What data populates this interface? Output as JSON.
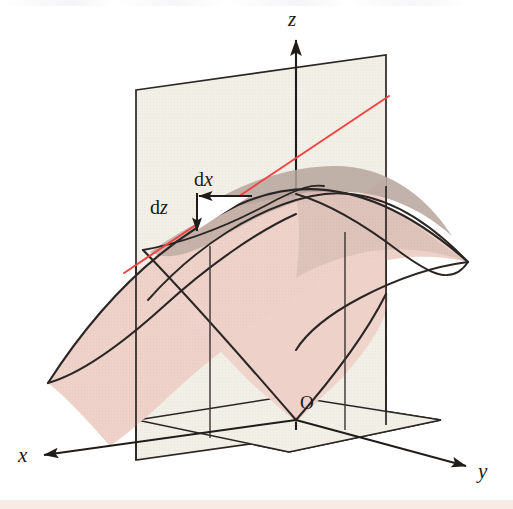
{
  "figure": {
    "axes": [
      {
        "name": "x-axis",
        "label": "x",
        "direction": "left",
        "label_x": 18,
        "label_y": 462
      },
      {
        "name": "y-axis",
        "label": "y",
        "direction": "down-right",
        "label_x": 478,
        "label_y": 478
      },
      {
        "name": "z-axis",
        "label": "z",
        "direction": "up",
        "label_x": 288,
        "label_y": 26
      }
    ],
    "origin": {
      "label": "O",
      "x": 300,
      "y": 409
    },
    "differentials": [
      {
        "name": "dx",
        "prefix": "d",
        "variable": "x",
        "label_x": 194,
        "label_y": 186
      },
      {
        "name": "dz",
        "prefix": "d",
        "variable": "z",
        "label_x": 150,
        "label_y": 214
      }
    ],
    "colors": {
      "surface_pink": "#eed2ca",
      "surface_pink_dark": "#e3c4bb",
      "surface_shadow": "#b6a49c",
      "plane_cream": "#f1efe6",
      "plane_cream_dark": "#eae7dc",
      "tangent_red": "#ef4444",
      "outline": "#2b2623",
      "background": "#ffffff",
      "bottom_strip": "#f7e6e0"
    },
    "elements": {
      "tangent_line": "red straight line tangent to the saddle surface",
      "vertical_plane": "light cream vertical plane containing the z axis",
      "base_plane": "light cream horizontal base plane",
      "saddle_surface": "pink hyperbolic paraboloid (saddle) surface",
      "dx_arrow": "horizontal arrow pointing left labelled dx",
      "dz_arrow": "vertical arrow pointing down labelled dz",
      "white_triangle": "white right triangle formed by dx and dz legs under the tangent line"
    }
  }
}
